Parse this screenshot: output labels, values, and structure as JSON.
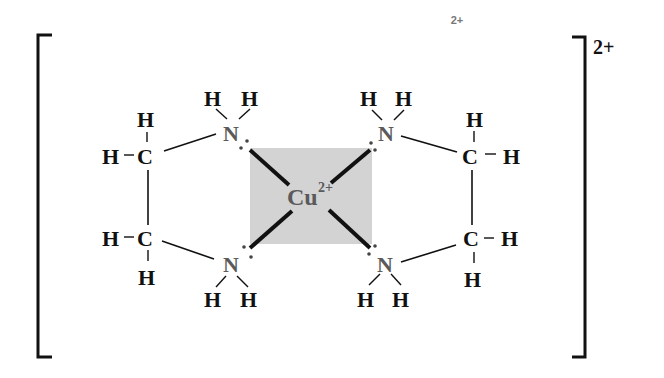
{
  "diagram": {
    "type": "coordination-complex",
    "stray_label": "2+",
    "overall_charge": "2+",
    "metal": {
      "symbol": "Cu",
      "charge": "2+",
      "box_color": "#d3d3d3"
    },
    "atoms": {
      "n_tl": "N",
      "n_tr": "N",
      "n_bl": "N",
      "n_br": "N",
      "c_tl": "C",
      "c_bl": "C",
      "c_tr": "C",
      "c_br": "C",
      "h": "H"
    },
    "bond_dash": "–"
  }
}
